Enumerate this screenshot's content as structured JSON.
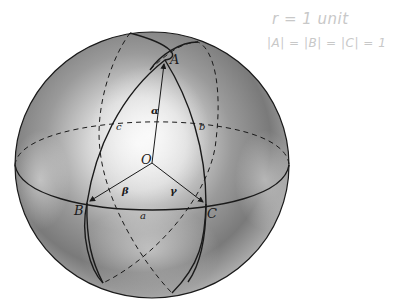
{
  "figure": {
    "points": {
      "A": "A",
      "B": "B",
      "C": "C",
      "O": "O"
    },
    "angles": {
      "alpha": "α",
      "beta": "β",
      "gamma": "γ"
    },
    "sides": {
      "a": "a",
      "b": "b",
      "c": "c"
    }
  },
  "annotations": {
    "radius_note": "r = 1 unit",
    "magnitude_note": "|A| = |B| = |C| = 1"
  },
  "colors": {
    "line": "#1a1a1a",
    "sphere_light": "#f4f4f4",
    "sphere_dark": "#6e6e6e",
    "annotation": "#c8c8c8"
  }
}
